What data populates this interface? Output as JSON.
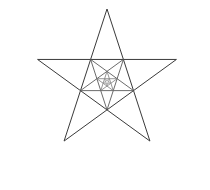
{
  "figure": {
    "background_color": "#ffffff",
    "canvas": {
      "width": 210,
      "height": 190
    }
  },
  "chart_data": {
    "type": "line",
    "xlabel": "",
    "ylabel": "",
    "grid": false,
    "legend_position": "none",
    "xlim": [
      0,
      210
    ],
    "ylim": [
      0,
      190
    ],
    "recursion": {
      "levels": 4,
      "orientation_alternates": true,
      "inner_scale_factor": 0.382,
      "level_rotation_degrees": 180
    },
    "series": [
      {
        "name": "level-1-pentagram",
        "level": 1,
        "color": "#3a3a3a",
        "linewidth": 1.0,
        "rotation_degrees": 0,
        "center": [
          107,
          82
        ],
        "circumradius": 73,
        "closed": true,
        "points": [
          [
            107,
            9
          ],
          [
            163,
            178
          ],
          [
            14,
            70
          ],
          [
            200,
            70
          ],
          [
            45,
            178
          ]
        ],
        "inner_pentagon": [
          [
            107,
            44
          ],
          [
            141,
            70
          ],
          [
            128,
            110
          ],
          [
            86,
            110
          ],
          [
            73,
            70
          ]
        ]
      },
      {
        "name": "level-2-pentagram",
        "level": 2,
        "color": "#5a5a5a",
        "linewidth": 0.9,
        "rotation_degrees": 180,
        "center": [
          107,
          82
        ],
        "circumradius": 27.9,
        "closed": true,
        "points": [
          [
            107,
            110
          ],
          [
            73,
            70
          ],
          [
            130,
            97
          ],
          [
            84,
            97
          ],
          [
            141,
            70
          ]
        ],
        "inner_pentagon": [
          [
            107,
            96
          ],
          [
            94,
            87
          ],
          [
            99,
            71
          ],
          [
            115,
            71
          ],
          [
            120,
            87
          ]
        ]
      },
      {
        "name": "level-3-pentagram",
        "level": 3,
        "color": "#7a7a7a",
        "linewidth": 0.8,
        "rotation_degrees": 0,
        "center": [
          107,
          82
        ],
        "circumradius": 10.66,
        "closed": true,
        "points": [
          [
            107,
            71
          ],
          [
            115,
            96
          ],
          [
            93,
            80
          ],
          [
            121,
            80
          ],
          [
            99,
            96
          ]
        ],
        "inner_pentagon": [
          [
            107,
            76
          ],
          [
            112,
            80
          ],
          [
            110,
            86
          ],
          [
            104,
            86
          ],
          [
            102,
            80
          ]
        ]
      },
      {
        "name": "level-4-pentagram",
        "level": 4,
        "color": "#9a9a9a",
        "linewidth": 0.7,
        "rotation_degrees": 180,
        "center": [
          107,
          82
        ],
        "circumradius": 4.07,
        "closed": true,
        "points": [
          [
            107,
            86
          ],
          [
            102,
            80
          ],
          [
            111,
            84
          ],
          [
            104,
            84
          ],
          [
            112,
            80
          ]
        ],
        "inner_pentagon": [
          [
            107,
            84
          ],
          [
            105,
            82
          ],
          [
            106,
            80
          ],
          [
            109,
            80
          ],
          [
            109,
            82
          ]
        ]
      }
    ],
    "annotations": []
  }
}
